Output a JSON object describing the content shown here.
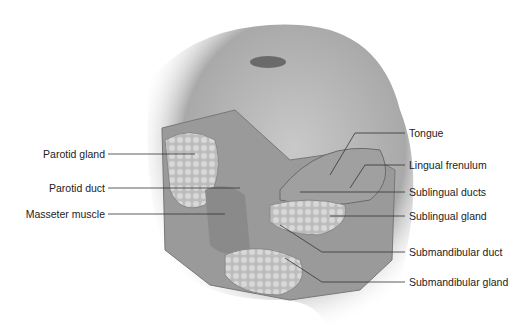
{
  "diagram": {
    "labels_left": [
      {
        "text": "Parotid gland",
        "y": 154
      },
      {
        "text": "Parotid duct",
        "y": 188
      },
      {
        "text": "Masseter muscle",
        "y": 214
      }
    ],
    "labels_right": [
      {
        "text": "Tongue",
        "y": 133
      },
      {
        "text": "Lingual frenulum",
        "y": 165
      },
      {
        "text": "Sublingual ducts",
        "y": 192
      },
      {
        "text": "Sublingual gland",
        "y": 216
      },
      {
        "text": "Submandibular duct",
        "y": 252
      },
      {
        "text": "Submandibular gland",
        "y": 282
      }
    ]
  }
}
